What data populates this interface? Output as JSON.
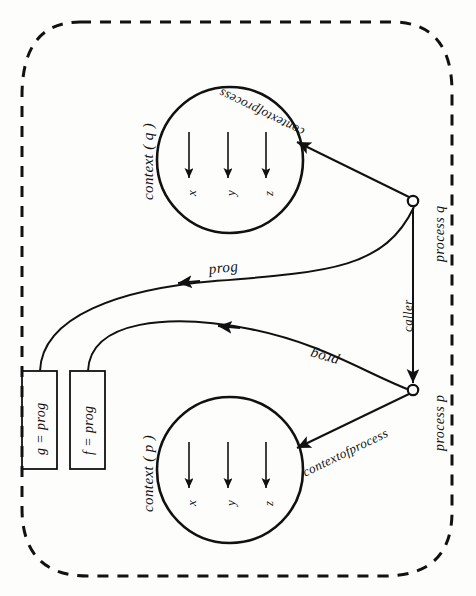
{
  "figure": {
    "type": "diagram",
    "title": "",
    "boundary": {
      "name": "system-boundary",
      "style": "dashed rounded rectangle"
    },
    "contexts": [
      {
        "id": "context-q",
        "label": "context ( q )",
        "variables": [
          "x",
          "y",
          "z"
        ],
        "arrow_direction": "down"
      },
      {
        "id": "context-p",
        "label": "context ( p )",
        "variables": [
          "x",
          "y",
          "z"
        ],
        "arrow_direction": "down"
      }
    ],
    "processes": [
      {
        "id": "process-q",
        "label": "process q"
      },
      {
        "id": "process-p",
        "label": "process p"
      }
    ],
    "programs": [
      {
        "id": "box-g",
        "label": "g = prog"
      },
      {
        "id": "box-f",
        "label": "f = prog"
      }
    ],
    "edges": [
      {
        "id": "edge-contextofprocess-q",
        "label": "contextofprocess",
        "from": "process q",
        "to": "context ( q )"
      },
      {
        "id": "edge-prog-q",
        "label": "prog",
        "from": "process q",
        "to": "g = prog"
      },
      {
        "id": "edge-caller",
        "label": "caller",
        "from": "process q",
        "to": "process p"
      },
      {
        "id": "edge-prog-p",
        "label": "prog",
        "from": "process p",
        "to": "f = prog"
      },
      {
        "id": "edge-contextofprocess-p",
        "label": "contextofprocess",
        "from": "process p",
        "to": "context ( p )"
      }
    ]
  },
  "colors": {
    "ink": "#111111",
    "paper": "#fdfdfc"
  }
}
